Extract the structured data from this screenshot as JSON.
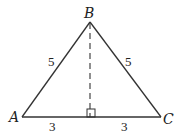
{
  "diagram": {
    "type": "isosceles-triangle",
    "vertices": {
      "A": "A",
      "B": "B",
      "C": "C"
    },
    "sides": {
      "AB": "5",
      "BC": "5",
      "AD": "3",
      "DC": "3"
    },
    "altitude": "dashed from B perpendicular to AC",
    "right_angle_marker": true,
    "stroke_color": "#333333"
  }
}
